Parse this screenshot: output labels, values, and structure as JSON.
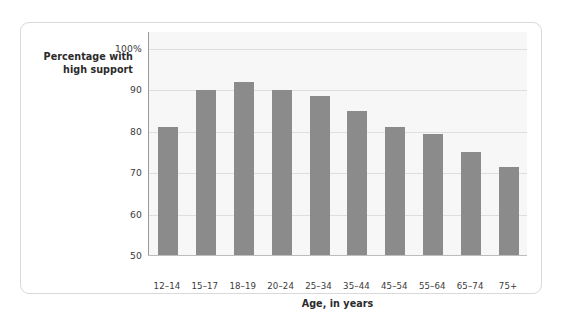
{
  "chart_data": {
    "type": "bar",
    "title": "",
    "subtitle": "",
    "xlabel": "Age, in years",
    "ylabel": "Percentage with high support",
    "ylabel_line1": "Percentage with",
    "ylabel_line2": "high support",
    "categories": [
      "12–14",
      "15–17",
      "18–19",
      "20–24",
      "25–34",
      "35–44",
      "45–54",
      "55–64",
      "65–74",
      "75+"
    ],
    "values": [
      81,
      90,
      92,
      90,
      88.5,
      85,
      81,
      79.5,
      75,
      71.5
    ],
    "ylim": [
      50,
      104
    ],
    "yticks": [
      50,
      60,
      70,
      80,
      90,
      100
    ],
    "ytick_labels": [
      "50",
      "60",
      "70",
      "80",
      "90",
      "100%"
    ],
    "grid": true,
    "legend": "none",
    "bar_color": "#8b8b8b",
    "plot_background": "#f7f7f7",
    "gridline_color": "#dedede",
    "axis_color": "#9a9a9a",
    "card_border_color": "#d9d9d9"
  }
}
